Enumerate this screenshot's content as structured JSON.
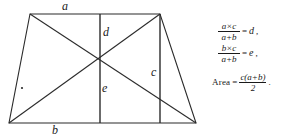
{
  "figure": {
    "name": "trapezoid-with-diagonals",
    "stroke_color": "#2b2b2b",
    "background_color": "#ffffff",
    "labels": {
      "a": "a",
      "b": "b",
      "c": "c",
      "d": "d",
      "e": "e"
    },
    "geometry": {
      "top_left": [
        30,
        14
      ],
      "top_right": [
        160,
        14
      ],
      "bottom_right": [
        196,
        123
      ],
      "bottom_left": [
        9,
        123
      ],
      "mid_vertical_x": 100,
      "right_vertical_x": 160,
      "diagonal_intersection": [
        100,
        60
      ],
      "interior_dot": [
        22,
        88
      ]
    }
  },
  "formulas": [
    {
      "id": "formula-d",
      "numerator": "a×c",
      "num_left": "a",
      "num_times": "×",
      "num_right": "c",
      "denominator": "a+b",
      "equals": "=",
      "result": "d",
      "trailing": ","
    },
    {
      "id": "formula-e",
      "numerator": "b×c",
      "num_left": "b",
      "num_times": "×",
      "num_right": "c",
      "denominator": "a+b",
      "equals": "=",
      "result": "e",
      "trailing": ","
    },
    {
      "id": "formula-area",
      "label": "Area",
      "equals": "=",
      "numerator": "c(a+b)",
      "denominator": "2",
      "trailing": "."
    }
  ]
}
